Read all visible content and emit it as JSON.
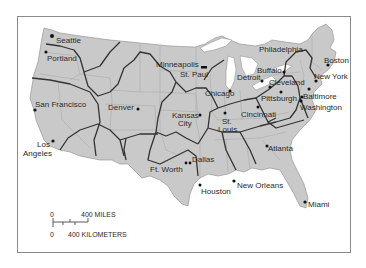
{
  "map": {
    "title": "",
    "colors": {
      "land": "#c9c9c9",
      "state_border": "#a4a4a4",
      "region_border": "#333333",
      "water": "#ffffff",
      "city_dot": "#111111",
      "frame": "#8a8a8a"
    },
    "cities": [
      {
        "name": "Seattle",
        "label": "Seattle"
      },
      {
        "name": "Portland",
        "label": "Portland"
      },
      {
        "name": "San Francisco",
        "label": "San Francisco"
      },
      {
        "name": "Los Angeles",
        "label_line1": "Los",
        "label_line2": "Angeles"
      },
      {
        "name": "Denver",
        "label": "Denver"
      },
      {
        "name": "Minneapolis-St. Paul",
        "label_line1": "Minneapolis",
        "label_line2": "St. Paul"
      },
      {
        "name": "Kansas City",
        "label_line1": "Kansas",
        "label_line2": "City"
      },
      {
        "name": "Chicago",
        "label": "Chicago"
      },
      {
        "name": "St. Louis",
        "label_line1": "St.",
        "label_line2": "Louis"
      },
      {
        "name": "Detroit",
        "label": "Detroit"
      },
      {
        "name": "Philadelphia",
        "label": "Philadelphia"
      },
      {
        "name": "Buffalo",
        "label": "Buffalo"
      },
      {
        "name": "Cleveland",
        "label": "Cleveland"
      },
      {
        "name": "Pittsburgh",
        "label": "Pittsburgh"
      },
      {
        "name": "Cincinnati",
        "label": "Cincinnati"
      },
      {
        "name": "Boston",
        "label": "Boston"
      },
      {
        "name": "New York",
        "label": "New York"
      },
      {
        "name": "Baltimore",
        "label": "Baltimore"
      },
      {
        "name": "Washington",
        "label": "Washington"
      },
      {
        "name": "Ft. Worth",
        "label": "Ft. Worth"
      },
      {
        "name": "Dallas",
        "label": "Dallas"
      },
      {
        "name": "Houston",
        "label": "Houston"
      },
      {
        "name": "New Orleans",
        "label": "New Orleans"
      },
      {
        "name": "Atlanta",
        "label": "Atlanta"
      },
      {
        "name": "Miami",
        "label": "Miami"
      }
    ],
    "scale_bar": {
      "miles_zero": "0",
      "miles_label": "400 MILES",
      "km_zero": "0",
      "km_label": "400 KILOMETERS"
    }
  }
}
